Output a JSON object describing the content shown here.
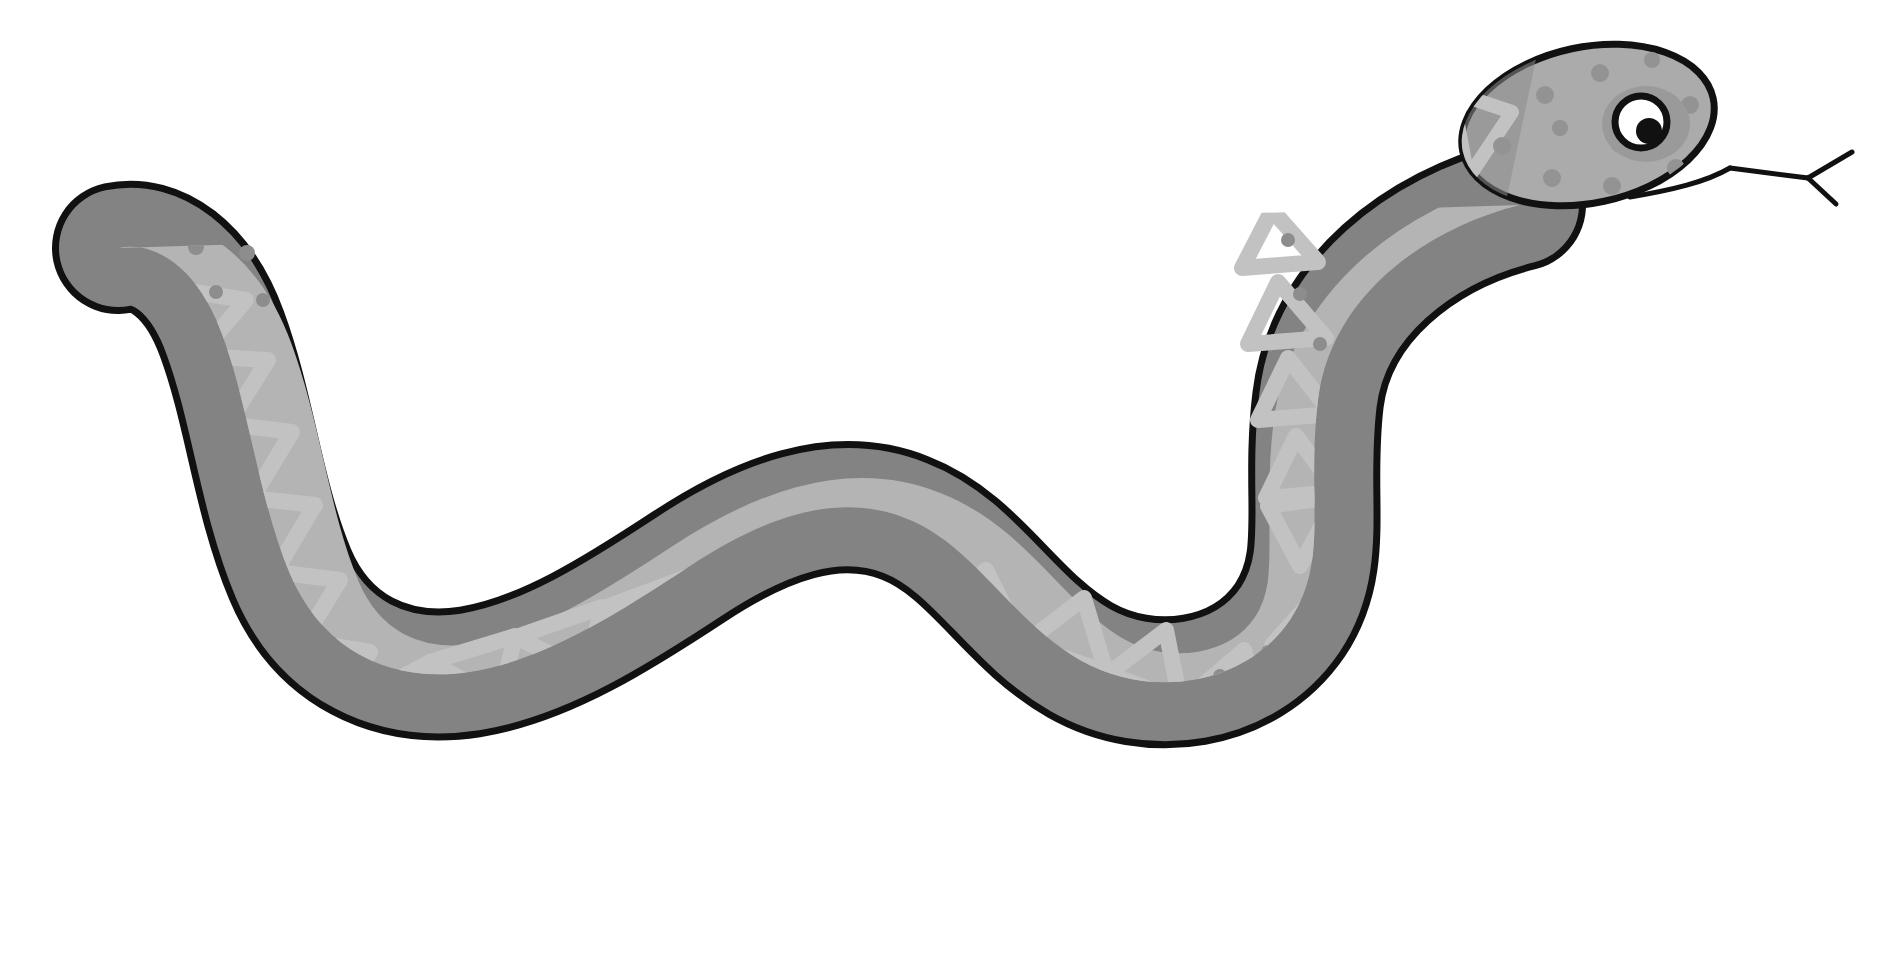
{
  "artwork": {
    "title": "Cartoon Snake Illustration",
    "subject": "snake",
    "style": "flat cartoon line art, grayscale",
    "canvas": {
      "width": 1903,
      "height": 960,
      "background_color": "#ffffff"
    }
  },
  "palette": {
    "background": "#ffffff",
    "outline": "#111111",
    "body_dark": "#838383",
    "body_light": "#a8a8a8",
    "belly_light": "#b4b4b4",
    "pattern_light": "#c2c2c2",
    "head_light": "#ababab",
    "spot_dark": "#8d8d8d",
    "eye_white": "#ffffff",
    "eye_pupil": "#111111",
    "eye_ring": "#111111",
    "tongue": "#111111"
  },
  "parts": {
    "head": {
      "name": "head",
      "label": "Snake head",
      "center": {
        "x": 1588,
        "y": 125
      },
      "rx": 128,
      "ry": 78,
      "rotation_deg": -12,
      "fill": "#ababab"
    },
    "eye": {
      "name": "eye",
      "label": "Eye",
      "center": {
        "x": 1641,
        "y": 122
      },
      "radius": 26,
      "ring_color": "#111111",
      "ring_width": 6,
      "sclera_color": "#ffffff",
      "pupil": {
        "cx": 1648,
        "cy": 131,
        "r": 13,
        "color": "#111111"
      },
      "highlight": {
        "cx": 1636,
        "cy": 112,
        "r": 5,
        "color": "#ffffff"
      },
      "socket_shadow": {
        "cx": 1646,
        "cy": 124,
        "rx": 42,
        "ry": 36,
        "color": "#9a9a9a"
      }
    },
    "mouth": {
      "name": "mouth",
      "label": "Mouth line",
      "color": "#111111",
      "stroke_width": 5
    },
    "tongue": {
      "name": "tongue",
      "label": "Forked tongue",
      "color": "#111111",
      "stroke_width": 5,
      "fork_count": 2
    },
    "body": {
      "name": "body",
      "label": "Snake body",
      "description": "Long S-curved body running from head at upper right to tail tip at upper left",
      "outline_color": "#111111",
      "outline_width": 7,
      "dark_fill": "#838383",
      "light_fill": "#b0b0b0"
    },
    "tail": {
      "name": "tail-tip",
      "label": "Tail tip",
      "position": {
        "x": 95,
        "y": 240
      },
      "fill": "#b4b4b4"
    }
  },
  "pattern": {
    "name": "scale-pattern",
    "label": "Diamond / triangle back pattern",
    "triangle_stroke_color": "#c2c2c2",
    "triangle_stroke_width": 15,
    "triangle_count": 22,
    "belly_band_color": "#b6b6b6",
    "spot_color": "#8d8d8d",
    "spot_radius": 7,
    "spot_count": 46
  },
  "spots": [
    {
      "x": 150,
      "y": 258
    },
    {
      "x": 196,
      "y": 247
    },
    {
      "x": 247,
      "y": 253
    },
    {
      "x": 216,
      "y": 292
    },
    {
      "x": 263,
      "y": 300
    },
    {
      "x": 219,
      "y": 480
    },
    {
      "x": 238,
      "y": 540
    },
    {
      "x": 262,
      "y": 600
    },
    {
      "x": 300,
      "y": 655
    },
    {
      "x": 352,
      "y": 694
    },
    {
      "x": 410,
      "y": 713
    },
    {
      "x": 470,
      "y": 700
    },
    {
      "x": 512,
      "y": 686
    },
    {
      "x": 560,
      "y": 666
    },
    {
      "x": 606,
      "y": 648
    },
    {
      "x": 660,
      "y": 622
    },
    {
      "x": 712,
      "y": 596
    },
    {
      "x": 762,
      "y": 570
    },
    {
      "x": 800,
      "y": 560
    },
    {
      "x": 852,
      "y": 556
    },
    {
      "x": 900,
      "y": 566
    },
    {
      "x": 944,
      "y": 580
    },
    {
      "x": 986,
      "y": 606
    },
    {
      "x": 1028,
      "y": 638
    },
    {
      "x": 1062,
      "y": 668
    },
    {
      "x": 1110,
      "y": 684
    },
    {
      "x": 1168,
      "y": 688
    },
    {
      "x": 1220,
      "y": 676
    },
    {
      "x": 1268,
      "y": 652
    },
    {
      "x": 1308,
      "y": 614
    },
    {
      "x": 1332,
      "y": 562
    },
    {
      "x": 1344,
      "y": 506
    },
    {
      "x": 1348,
      "y": 452
    },
    {
      "x": 1336,
      "y": 398
    },
    {
      "x": 1318,
      "y": 344
    },
    {
      "x": 1296,
      "y": 294
    },
    {
      "x": 1285,
      "y": 240
    },
    {
      "x": 1236,
      "y": 118
    },
    {
      "x": 1288,
      "y": 92
    },
    {
      "x": 1318,
      "y": 70
    },
    {
      "x": 1262,
      "y": 152
    },
    {
      "x": 1356,
      "y": 148
    },
    {
      "x": 1490,
      "y": 72
    },
    {
      "x": 1545,
      "y": 95
    },
    {
      "x": 1600,
      "y": 75
    },
    {
      "x": 1690,
      "y": 105
    },
    {
      "x": 1676,
      "y": 165
    },
    {
      "x": 1560,
      "y": 175
    },
    {
      "x": 1500,
      "y": 145
    }
  ]
}
